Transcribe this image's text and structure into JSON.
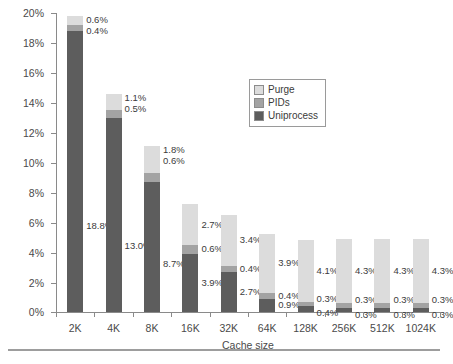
{
  "chart_data": {
    "type": "bar",
    "subtype": "stacked-bar",
    "title": "",
    "xlabel": "Cache size",
    "ylabel": "Miss rate",
    "ylim": [
      0,
      20
    ],
    "ytick_step": 2,
    "ytick_labels": [
      "0%",
      "2%",
      "4%",
      "6%",
      "8%",
      "10%",
      "12%",
      "14%",
      "16%",
      "18%",
      "20%"
    ],
    "grid": false,
    "legend_position": "inside-upper-right",
    "categories": [
      "2K",
      "4K",
      "8K",
      "16K",
      "32K",
      "64K",
      "128K",
      "256K",
      "512K",
      "1024K"
    ],
    "series": [
      {
        "name": "Uniprocess",
        "color": "#5d5d5d",
        "values": [
          18.8,
          13.0,
          8.7,
          3.9,
          2.7,
          0.9,
          0.4,
          0.3,
          0.3,
          0.3
        ],
        "labels": [
          "18.8%",
          "13.0%",
          "8.7%",
          "3.9%",
          "2.7%",
          "0.9%",
          "0.4%",
          "0.3%",
          "0.3%",
          "0.3%"
        ]
      },
      {
        "name": "PIDs",
        "color": "#a3a3a3",
        "values": [
          0.4,
          0.5,
          0.6,
          0.6,
          0.4,
          0.4,
          0.3,
          0.3,
          0.3,
          0.3
        ],
        "labels": [
          "0.4%",
          "0.5%",
          "0.6%",
          "0.6%",
          "0.4%",
          "0.4%",
          "0.3%",
          "0.3%",
          "0.3%",
          "0.3%"
        ]
      },
      {
        "name": "Purge",
        "color": "#dcdcdc",
        "values": [
          0.6,
          1.1,
          1.8,
          2.7,
          3.4,
          3.9,
          4.1,
          4.3,
          4.3,
          4.3
        ],
        "labels": [
          "0.6%",
          "1.1%",
          "1.8%",
          "2.7%",
          "3.4%",
          "3.9%",
          "4.1%",
          "4.3%",
          "4.3%",
          "4.3%"
        ]
      }
    ],
    "totals": [
      19.8,
      14.6,
      11.1,
      7.2,
      6.5,
      5.2,
      4.8,
      4.9,
      4.9,
      4.9
    ]
  },
  "legend": {
    "items": [
      {
        "label": "Purge",
        "color": "#dcdcdc"
      },
      {
        "label": "PIDs",
        "color": "#a3a3a3"
      },
      {
        "label": "Uniprocess",
        "color": "#5d5d5d"
      }
    ]
  },
  "caption": {
    "text": ""
  }
}
